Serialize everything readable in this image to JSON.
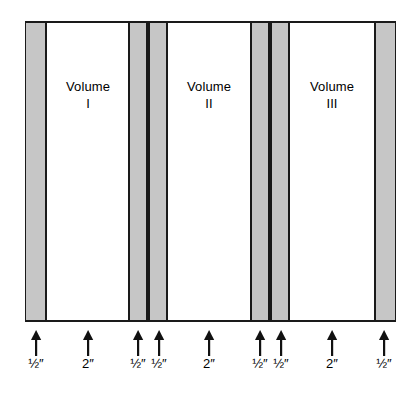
{
  "figure": {
    "type": "technical-cross-section-diagram",
    "box": {
      "x": 25,
      "y": 21,
      "width": 371,
      "height": 301
    },
    "colors": {
      "band_fill": "#c6c6c6",
      "gap_fill": "#ffffff",
      "outline": "#1a1a1a",
      "text": "#000000",
      "background": "#ffffff"
    }
  },
  "bands": [
    {
      "name": "divider-1",
      "x": 26,
      "width": 21,
      "edge": "left"
    },
    {
      "name": "divider-2",
      "x": 128,
      "width": 20,
      "edge": "none"
    },
    {
      "name": "divider-3",
      "x": 148,
      "width": 20,
      "edge": "none"
    },
    {
      "name": "divider-4",
      "x": 250,
      "width": 20,
      "edge": "none"
    },
    {
      "name": "divider-5",
      "x": 270,
      "width": 20,
      "edge": "none"
    },
    {
      "name": "divider-6",
      "x": 374,
      "width": 21,
      "edge": "right"
    }
  ],
  "volumes": [
    {
      "title": "Volume",
      "numeral": "I",
      "center_x": 88,
      "label_top": 78
    },
    {
      "title": "Volume",
      "numeral": "II",
      "center_x": 209,
      "label_top": 78
    },
    {
      "title": "Volume",
      "numeral": "III",
      "center_x": 332,
      "label_top": 78
    }
  ],
  "measurements": [
    {
      "id": "m1",
      "value": "½",
      "unit": "″",
      "full": "½″",
      "arrow_x": 36,
      "refers_to": "divider-1"
    },
    {
      "id": "m2",
      "value": "2",
      "unit": "″",
      "full": "2″",
      "arrow_x": 88,
      "refers_to": "Volume I gap"
    },
    {
      "id": "m3",
      "value": "½",
      "unit": "″",
      "full": "½″",
      "arrow_x": 138,
      "refers_to": "divider-2"
    },
    {
      "id": "m4",
      "value": "½",
      "unit": "″",
      "full": "½″",
      "arrow_x": 159,
      "refers_to": "divider-3"
    },
    {
      "id": "m5",
      "value": "2",
      "unit": "″",
      "full": "2″",
      "arrow_x": 209,
      "refers_to": "Volume II gap"
    },
    {
      "id": "m6",
      "value": "½",
      "unit": "″",
      "full": "½″",
      "arrow_x": 260,
      "refers_to": "divider-4"
    },
    {
      "id": "m7",
      "value": "½",
      "unit": "″",
      "full": "½″",
      "arrow_x": 281,
      "refers_to": "divider-5"
    },
    {
      "id": "m8",
      "value": "2",
      "unit": "″",
      "full": "2″",
      "arrow_x": 332,
      "refers_to": "Volume III gap"
    },
    {
      "id": "m9",
      "value": "½",
      "unit": "″",
      "full": "½″",
      "arrow_x": 384,
      "refers_to": "divider-6"
    }
  ]
}
